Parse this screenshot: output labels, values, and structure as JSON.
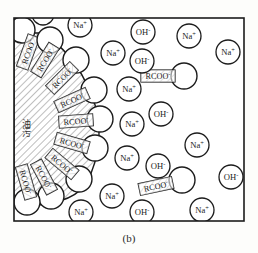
{
  "figure": {
    "caption": "(b)",
    "frame": {
      "x": 14,
      "y": 18,
      "width": 230,
      "height": 203,
      "stroke": "#1c1c1c",
      "stroke_width": 1.6
    },
    "background": "#ffffff"
  },
  "labels": {
    "surfactant": "RCOO",
    "surfactant_charge": "-",
    "sodium": "Na",
    "sodium_charge": "+",
    "hydroxide": "OH",
    "hydroxide_charge": "-",
    "oil_droplet": "油污"
  },
  "colors": {
    "ink": "#1c1c1c",
    "hatch": "#6e6e6e",
    "paper": "#ffffff",
    "page": "#fdfdfb"
  },
  "oil_droplet": {
    "name": "oil-droplet",
    "hatch_spacing": 5,
    "hatch_angle": 45,
    "outline_path": "M 14 33 L 40 33 C 62 44 80 66 92 96 C 103 124 101 156 86 184 C 74 200 52 206 14 206 Z"
  },
  "anchored_surfactants": [
    {
      "id": 1,
      "cx": 28,
      "cy": 52,
      "angle": -70,
      "head_x": 22,
      "head_y": 30,
      "head_r": 13
    },
    {
      "id": 2,
      "cx": 45,
      "cy": 60,
      "angle": -58,
      "head_x": 50,
      "head_y": 40,
      "head_r": 13
    },
    {
      "id": 3,
      "cx": 62,
      "cy": 78,
      "angle": -45,
      "head_x": 76,
      "head_y": 60,
      "head_r": 13
    },
    {
      "id": 4,
      "cx": 72,
      "cy": 100,
      "angle": -24,
      "head_x": 94,
      "head_y": 90,
      "head_r": 13
    },
    {
      "id": 5,
      "cx": 76,
      "cy": 121,
      "angle": -4,
      "head_x": 100,
      "head_y": 119,
      "head_r": 13
    },
    {
      "id": 6,
      "cx": 72,
      "cy": 143,
      "angle": 16,
      "head_x": 95,
      "head_y": 148,
      "head_r": 13
    },
    {
      "id": 7,
      "cx": 62,
      "cy": 164,
      "angle": 40,
      "head_x": 79,
      "head_y": 179,
      "head_r": 13
    },
    {
      "id": 8,
      "cx": 44,
      "cy": 177,
      "angle": 62,
      "head_x": 51,
      "head_y": 196,
      "head_r": 13
    },
    {
      "id": 9,
      "cx": 26,
      "cy": 182,
      "angle": 74,
      "head_x": 27,
      "head_y": 202,
      "head_r": 13
    }
  ],
  "free_surfactants": [
    {
      "id": "f1",
      "tail_cx": 158,
      "tail_cy": 76,
      "angle": 0,
      "head_x": 184,
      "head_y": 76,
      "head_r": 13
    },
    {
      "id": "f2",
      "tail_cx": 156,
      "tail_cy": 186,
      "angle": -12,
      "head_x": 182,
      "head_y": 180,
      "head_r": 13
    }
  ],
  "sodium_ions": [
    {
      "id": "na1",
      "x": 80,
      "y": 25,
      "r": 12
    },
    {
      "id": "na2",
      "x": 189,
      "y": 36,
      "r": 12
    },
    {
      "id": "na3",
      "x": 228,
      "y": 52,
      "r": 12
    },
    {
      "id": "na4",
      "x": 113,
      "y": 53,
      "r": 12
    },
    {
      "id": "na5",
      "x": 129,
      "y": 89,
      "r": 12
    },
    {
      "id": "na6",
      "x": 132,
      "y": 124,
      "r": 12
    },
    {
      "id": "na7",
      "x": 197,
      "y": 145,
      "r": 12
    },
    {
      "id": "na8",
      "x": 127,
      "y": 158,
      "r": 12
    },
    {
      "id": "na9",
      "x": 112,
      "y": 196,
      "r": 12
    },
    {
      "id": "na10",
      "x": 81,
      "y": 212,
      "r": 12
    },
    {
      "id": "na11",
      "x": 202,
      "y": 210,
      "r": 12
    }
  ],
  "hydroxide_ions": [
    {
      "id": "oh1",
      "x": 143,
      "y": 32,
      "r": 12
    },
    {
      "id": "oh2",
      "x": 142,
      "y": 61,
      "r": 12
    },
    {
      "id": "oh3",
      "x": 161,
      "y": 114,
      "r": 12
    },
    {
      "id": "oh4",
      "x": 158,
      "y": 166,
      "r": 12
    },
    {
      "id": "oh5",
      "x": 231,
      "y": 177,
      "r": 12
    },
    {
      "id": "oh6",
      "x": 142,
      "y": 212,
      "r": 12
    }
  ],
  "edge_ions": [
    {
      "id": "top-cut",
      "x": 43,
      "y": 14,
      "r": 11
    }
  ]
}
